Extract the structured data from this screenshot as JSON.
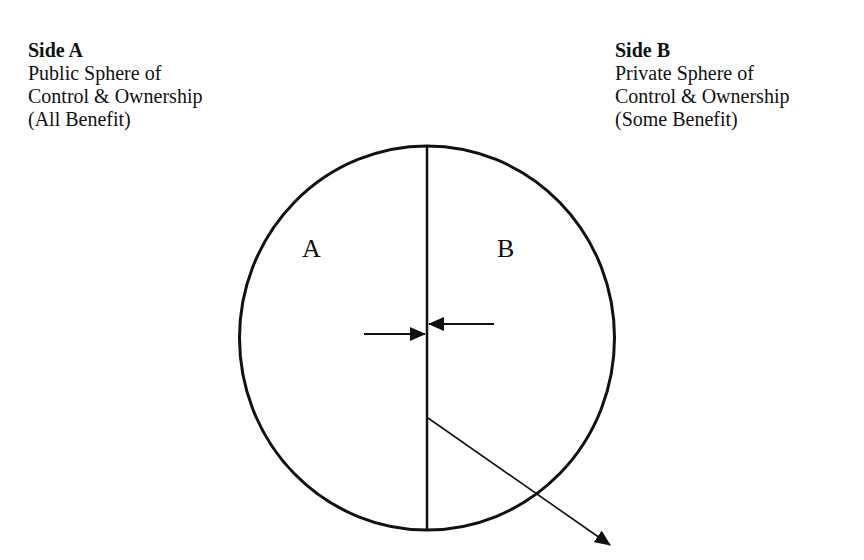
{
  "side_a": {
    "title": "Side A",
    "lines": [
      "Public Sphere of",
      "Control & Ownership",
      "(All Benefit)"
    ]
  },
  "side_b": {
    "title": "Side B",
    "lines": [
      "Private Sphere of",
      "Control & Ownership",
      "(Some Benefit)"
    ]
  },
  "regions": {
    "left": "A",
    "right": "B"
  },
  "colors": {
    "stroke": "#111111",
    "background": "#ffffff"
  }
}
